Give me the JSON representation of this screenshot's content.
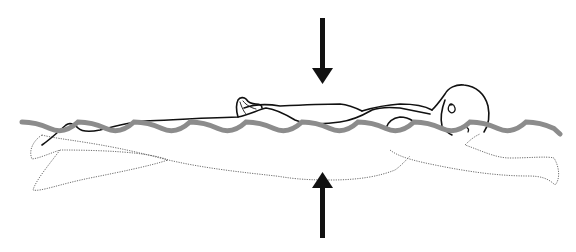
{
  "diagram": {
    "colors": {
      "background": "#ffffff",
      "outline": "#111111",
      "wave": "#8c8c8c",
      "dotted_outline": "#6e6e6e",
      "arrow": "#111111"
    },
    "wave": {
      "start_x": 22,
      "end_x": 560,
      "center_y": 128,
      "amplitude": 6.5,
      "period": 56,
      "stroke_width": 5
    },
    "arrows": [
      {
        "name": "downward-pressure-arrow",
        "direction": "down",
        "x": 322,
        "y_start": 18,
        "y_end": 84
      },
      {
        "name": "upward-pressure-arrow",
        "direction": "up",
        "x": 322,
        "y_start": 238,
        "y_end": 172
      }
    ],
    "labels": []
  }
}
